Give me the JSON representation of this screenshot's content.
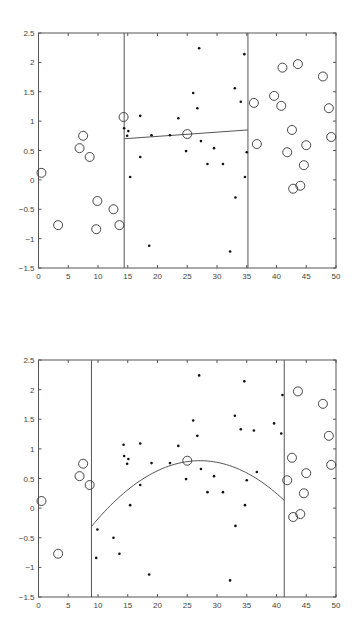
{
  "chart_data": [
    {
      "type": "scatter",
      "title": "",
      "xlabel": "",
      "ylabel": "",
      "xlim": [
        0,
        50
      ],
      "ylim": [
        -1.5,
        2.5
      ],
      "x_ticks": [
        "0",
        "5",
        "10",
        "15",
        "20",
        "25",
        "30",
        "35",
        "40",
        "45",
        "50"
      ],
      "y_ticks": [
        "-1.5",
        "-1",
        "-0.5",
        "0",
        "0.5",
        "1",
        "1.5",
        "2",
        "2.5"
      ],
      "grid": false,
      "boundaries": [
        14.4,
        35.2
      ],
      "fit": {
        "kind": "linear",
        "x": [
          14.4,
          35.2
        ],
        "y": [
          0.7,
          0.85
        ]
      },
      "series": [
        {
          "name": "outside (circles)",
          "marker": "circle",
          "points": [
            [
              0.5,
              0.12
            ],
            [
              3.3,
              -0.77
            ],
            [
              6.9,
              0.54
            ],
            [
              7.5,
              0.75
            ],
            [
              8.6,
              0.39
            ],
            [
              9.9,
              -0.36
            ],
            [
              9.7,
              -0.84
            ],
            [
              12.6,
              -0.5
            ],
            [
              13.6,
              -0.77
            ],
            [
              14.3,
              1.07
            ],
            [
              25.0,
              0.78
            ],
            [
              36.2,
              1.31
            ],
            [
              36.7,
              0.61
            ],
            [
              39.6,
              1.43
            ],
            [
              40.8,
              1.26
            ],
            [
              41.0,
              1.91
            ],
            [
              41.8,
              0.47
            ],
            [
              42.6,
              0.85
            ],
            [
              42.8,
              -0.15
            ],
            [
              43.6,
              1.97
            ],
            [
              44.0,
              -0.1
            ],
            [
              44.6,
              0.25
            ],
            [
              45.0,
              0.59
            ],
            [
              47.8,
              1.76
            ],
            [
              48.8,
              1.22
            ],
            [
              49.2,
              0.73
            ]
          ]
        },
        {
          "name": "inside (dots)",
          "marker": "dot",
          "points": [
            [
              14.9,
              0.75
            ],
            [
              15.1,
              0.83
            ],
            [
              14.4,
              0.88
            ],
            [
              15.4,
              0.05
            ],
            [
              17.1,
              1.09
            ],
            [
              17.1,
              0.39
            ],
            [
              18.6,
              -1.12
            ],
            [
              19.0,
              0.76
            ],
            [
              22.1,
              0.76
            ],
            [
              23.5,
              1.05
            ],
            [
              24.8,
              0.49
            ],
            [
              26.0,
              1.48
            ],
            [
              26.7,
              1.22
            ],
            [
              27.0,
              2.24
            ],
            [
              27.3,
              0.66
            ],
            [
              28.4,
              0.27
            ],
            [
              29.5,
              0.54
            ],
            [
              31.0,
              0.27
            ],
            [
              32.2,
              -1.22
            ],
            [
              33.0,
              1.56
            ],
            [
              33.1,
              -0.3
            ],
            [
              34.0,
              1.33
            ],
            [
              34.6,
              2.14
            ],
            [
              34.7,
              0.05
            ],
            [
              35.0,
              0.47
            ]
          ]
        }
      ]
    },
    {
      "type": "scatter",
      "title": "",
      "xlabel": "",
      "ylabel": "",
      "xlim": [
        0,
        50
      ],
      "ylim": [
        -1.5,
        2.5
      ],
      "x_ticks": [
        "0",
        "5",
        "10",
        "15",
        "20",
        "25",
        "30",
        "35",
        "40",
        "45",
        "50"
      ],
      "y_ticks": [
        "-1.5",
        "-1",
        "-0.5",
        "0",
        "0.5",
        "1",
        "1.5",
        "2",
        "2.5"
      ],
      "grid": false,
      "boundaries": [
        8.9,
        41.3
      ],
      "fit": {
        "kind": "quadratic",
        "x": [
          8.9,
          26.7,
          41.3
        ],
        "y": [
          -0.31,
          0.8,
          0.13
        ]
      },
      "series": [
        {
          "name": "outside (circles)",
          "marker": "circle",
          "points": [
            [
              0.5,
              0.12
            ],
            [
              3.3,
              -0.77
            ],
            [
              6.9,
              0.54
            ],
            [
              7.5,
              0.75
            ],
            [
              8.6,
              0.39
            ],
            [
              25.0,
              0.8
            ],
            [
              41.8,
              0.47
            ],
            [
              42.6,
              0.85
            ],
            [
              42.8,
              -0.15
            ],
            [
              43.6,
              1.97
            ],
            [
              44.0,
              -0.1
            ],
            [
              44.6,
              0.25
            ],
            [
              45.0,
              0.59
            ],
            [
              47.8,
              1.76
            ],
            [
              48.8,
              1.22
            ],
            [
              49.2,
              0.73
            ]
          ]
        },
        {
          "name": "inside (dots)",
          "marker": "dot",
          "points": [
            [
              9.9,
              -0.36
            ],
            [
              9.7,
              -0.84
            ],
            [
              12.6,
              -0.5
            ],
            [
              13.6,
              -0.77
            ],
            [
              14.3,
              1.07
            ],
            [
              14.9,
              0.75
            ],
            [
              15.1,
              0.83
            ],
            [
              14.4,
              0.88
            ],
            [
              15.4,
              0.05
            ],
            [
              17.1,
              1.09
            ],
            [
              17.1,
              0.39
            ],
            [
              18.6,
              -1.12
            ],
            [
              19.0,
              0.76
            ],
            [
              22.1,
              0.76
            ],
            [
              23.5,
              1.05
            ],
            [
              24.8,
              0.49
            ],
            [
              26.0,
              1.48
            ],
            [
              26.7,
              1.22
            ],
            [
              27.0,
              2.24
            ],
            [
              27.3,
              0.66
            ],
            [
              28.4,
              0.27
            ],
            [
              29.5,
              0.54
            ],
            [
              31.0,
              0.27
            ],
            [
              32.2,
              -1.22
            ],
            [
              33.0,
              1.56
            ],
            [
              33.1,
              -0.3
            ],
            [
              34.0,
              1.33
            ],
            [
              34.6,
              2.14
            ],
            [
              34.7,
              0.05
            ],
            [
              35.0,
              0.47
            ],
            [
              36.2,
              1.31
            ],
            [
              36.7,
              0.61
            ],
            [
              39.6,
              1.43
            ],
            [
              40.8,
              1.26
            ],
            [
              41.0,
              1.91
            ]
          ]
        }
      ]
    }
  ]
}
